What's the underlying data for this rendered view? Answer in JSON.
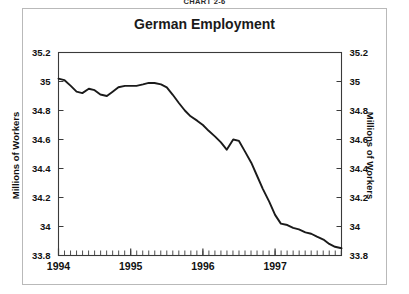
{
  "figure": {
    "chart_number": "Chart 2-6"
  },
  "chart_data": {
    "type": "line",
    "title": "German Employment",
    "xlabel": "",
    "ylabel": "Millions of Workers",
    "ylabel_right": "Millions of Workers",
    "ylim": [
      33.8,
      35.2
    ],
    "xlim": [
      1994.0,
      1997.92
    ],
    "grid": false,
    "legend": null,
    "y_ticks": [
      "35.2",
      "35",
      "34.8",
      "34.6",
      "34.4",
      "34.2",
      "34",
      "33.8"
    ],
    "y_tick_values": [
      35.2,
      35.0,
      34.8,
      34.6,
      34.4,
      34.2,
      34.0,
      33.8
    ],
    "x_ticks": [
      "1994",
      "1995",
      "1996",
      "1997"
    ],
    "x_tick_values": [
      1994,
      1995,
      1996,
      1997
    ],
    "minor_x_ticks": "monthly",
    "series": [
      {
        "name": "German Employment",
        "color": "#1a1a1a",
        "x": [
          1994.0,
          1994.08,
          1994.17,
          1994.25,
          1994.33,
          1994.42,
          1994.5,
          1994.58,
          1994.67,
          1994.75,
          1994.83,
          1994.92,
          1995.0,
          1995.08,
          1995.17,
          1995.25,
          1995.33,
          1995.42,
          1995.5,
          1995.58,
          1995.67,
          1995.75,
          1995.83,
          1995.92,
          1996.0,
          1996.08,
          1996.17,
          1996.25,
          1996.33,
          1996.42,
          1996.5,
          1996.58,
          1996.67,
          1996.75,
          1996.83,
          1996.92,
          1997.0,
          1997.08,
          1997.17,
          1997.25,
          1997.33,
          1997.42,
          1997.5,
          1997.58,
          1997.67,
          1997.75,
          1997.83,
          1997.92
        ],
        "values": [
          35.02,
          35.01,
          34.97,
          34.93,
          34.92,
          34.95,
          34.94,
          34.91,
          34.9,
          34.93,
          34.96,
          34.97,
          34.97,
          34.97,
          34.98,
          34.99,
          34.99,
          34.98,
          34.96,
          34.91,
          34.85,
          34.8,
          34.76,
          34.73,
          34.7,
          34.66,
          34.62,
          34.58,
          34.53,
          34.6,
          34.59,
          34.52,
          34.44,
          34.35,
          34.26,
          34.17,
          34.08,
          34.02,
          34.01,
          33.99,
          33.98,
          33.96,
          33.95,
          33.93,
          33.91,
          33.88,
          33.86,
          33.85
        ]
      }
    ]
  }
}
